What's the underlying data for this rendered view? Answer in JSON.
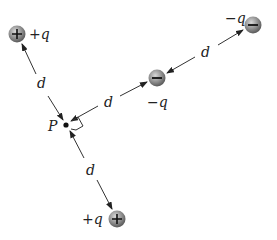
{
  "diagram": {
    "point": {
      "label": "P",
      "x": 66,
      "y": 125
    },
    "distance_label": "d",
    "charges": [
      {
        "id": "top-left",
        "sign": "+",
        "label": "+q",
        "x": 17,
        "y": 34,
        "label_x": 30,
        "label_y": 40
      },
      {
        "id": "middle",
        "sign": "−",
        "label": "−q",
        "x": 157,
        "y": 78,
        "label_x": 148,
        "label_y": 108
      },
      {
        "id": "top-right",
        "sign": "−",
        "label": "−q",
        "x": 253,
        "y": 25,
        "label_x": 226,
        "label_y": 24
      },
      {
        "id": "bottom",
        "sign": "+",
        "label": "+q",
        "x": 117,
        "y": 219,
        "label_x": 83,
        "label_y": 225
      }
    ],
    "distances": [
      {
        "id": "p-to-topleft",
        "label": "d",
        "label_x": 42,
        "label_y": 85
      },
      {
        "id": "p-to-middle",
        "label": "d",
        "label_x": 107,
        "label_y": 106
      },
      {
        "id": "middle-to-topright",
        "label": "d",
        "label_x": 204,
        "label_y": 56
      },
      {
        "id": "p-to-bottom",
        "label": "d",
        "label_x": 90,
        "label_y": 172
      }
    ],
    "colors": {
      "line": "#333333",
      "charge_fill": "#8a8a8a",
      "charge_edge": "#555555",
      "text": "#222222"
    }
  }
}
